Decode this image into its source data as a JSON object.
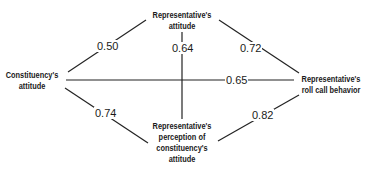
{
  "diagram": {
    "nodes": {
      "rep_attitude": {
        "lines": [
          "Representative's",
          "attitude"
        ]
      },
      "constituency_attitude": {
        "lines": [
          "Constituency's",
          "attitude"
        ]
      },
      "roll_call": {
        "lines": [
          "Representative's",
          "roll call behavior"
        ]
      },
      "perception": {
        "lines": [
          "Representative's",
          "perception of",
          "constituency's",
          "attitude"
        ]
      }
    },
    "edges": [
      {
        "from": "Constituency's attitude",
        "to": "Representative's attitude",
        "value": "0.50"
      },
      {
        "from": "Representative's attitude",
        "to": "Representative's roll call behavior",
        "value": "0.72"
      },
      {
        "from": "Representative's attitude",
        "to": "Representative's perception of constituency's attitude",
        "value": "0.64"
      },
      {
        "from": "Constituency's attitude",
        "to": "Representative's roll call behavior",
        "value": "0.65"
      },
      {
        "from": "Constituency's attitude",
        "to": "Representative's perception of constituency's attitude",
        "value": "0.74"
      },
      {
        "from": "Representative's perception of constituency's attitude",
        "to": "Representative's roll call behavior",
        "value": "0.82"
      }
    ]
  }
}
